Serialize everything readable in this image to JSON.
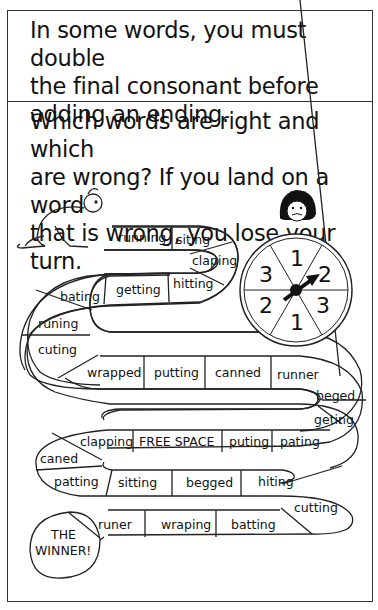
{
  "intro": {
    "lines": [
      "In some words, you must double",
      "the final consonant before",
      "adding an ending."
    ]
  },
  "instructions": {
    "lines": [
      "Which words are right and which",
      "are wrong? If you land on a word",
      "that is wrong, you lose your turn."
    ]
  },
  "board": {
    "row1": [
      "running",
      "siting",
      "claping",
      "hitting"
    ],
    "row2": [
      "getting",
      "bating",
      "runing",
      "cuting"
    ],
    "row3": [
      "wrapped",
      "putting",
      "canned",
      "runner",
      "beged",
      "geting"
    ],
    "row4": [
      "pating",
      "puting",
      "FREE SPACE",
      "clapping",
      "caned"
    ],
    "row5": [
      "patting",
      "sitting",
      "begged",
      "hiting",
      "cutting"
    ],
    "row6": [
      "batting",
      "wraping",
      "runer"
    ],
    "finish": [
      "THE",
      "WINNER!"
    ]
  },
  "spinner": {
    "numbers": [
      "1",
      "2",
      "3",
      "1",
      "2",
      "3"
    ]
  },
  "colors": {
    "ink": "#111111",
    "border": "#333333",
    "paper": "#ffffff"
  }
}
